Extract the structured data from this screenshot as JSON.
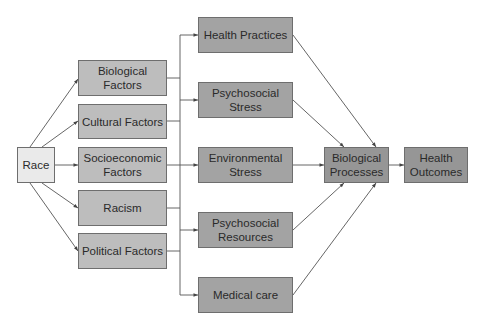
{
  "diagram": {
    "colors": {
      "source_fill": "#eaeaea",
      "factor_fill": "#bdbdbd",
      "pathway_fill": "#a3a3a3",
      "process_fill": "#969696",
      "border": "#6e6e6e",
      "line": "#555555"
    },
    "source": {
      "id": "race",
      "label": "Race"
    },
    "factors": [
      {
        "id": "biological-factors",
        "label": "Biological Factors"
      },
      {
        "id": "cultural-factors",
        "label": "Cultural Factors"
      },
      {
        "id": "socioeconomic-factors",
        "label": "Socioeconomic Factors"
      },
      {
        "id": "racism",
        "label": "Racism"
      },
      {
        "id": "political-factors",
        "label": "Political Factors"
      }
    ],
    "pathways": [
      {
        "id": "health-practices",
        "label": "Health Practices"
      },
      {
        "id": "psychosocial-stress",
        "label": "Psychosocial Stress"
      },
      {
        "id": "environmental-stress",
        "label": "Environmental Stress"
      },
      {
        "id": "psychosocial-resources",
        "label": "Psychosocial Resources"
      },
      {
        "id": "medical-care",
        "label": "Medical care"
      }
    ],
    "process": {
      "id": "biological-processes",
      "label": "Biological Processes"
    },
    "outcome": {
      "id": "health-outcomes",
      "label": "Health Outcomes"
    },
    "edges": [
      [
        "race",
        "biological-factors"
      ],
      [
        "race",
        "cultural-factors"
      ],
      [
        "race",
        "socioeconomic-factors"
      ],
      [
        "race",
        "racism"
      ],
      [
        "race",
        "political-factors"
      ],
      [
        "factors-bus",
        "health-practices"
      ],
      [
        "factors-bus",
        "psychosocial-stress"
      ],
      [
        "factors-bus",
        "environmental-stress"
      ],
      [
        "factors-bus",
        "psychosocial-resources"
      ],
      [
        "factors-bus",
        "medical-care"
      ],
      [
        "health-practices",
        "biological-processes"
      ],
      [
        "psychosocial-stress",
        "biological-processes"
      ],
      [
        "environmental-stress",
        "biological-processes"
      ],
      [
        "psychosocial-resources",
        "biological-processes"
      ],
      [
        "medical-care",
        "biological-processes"
      ],
      [
        "biological-processes",
        "health-outcomes"
      ]
    ]
  }
}
